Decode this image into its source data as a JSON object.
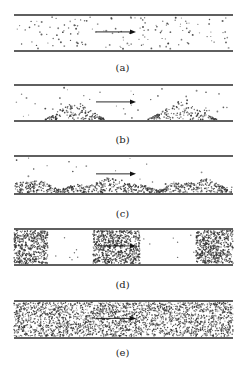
{
  "figure": {
    "panels": [
      {
        "id": "a",
        "label": "(a)",
        "regime": "dispersed",
        "top": 15,
        "bottom": 51,
        "label_y": 62
      },
      {
        "id": "b",
        "label": "(b)",
        "regime": "dunes",
        "top": 85,
        "bottom": 121,
        "label_y": 134
      },
      {
        "id": "c",
        "label": "(c)",
        "regime": "moving-bed",
        "top": 156,
        "bottom": 194,
        "label_y": 208
      },
      {
        "id": "d",
        "label": "(d)",
        "regime": "plugs",
        "top": 229,
        "bottom": 265,
        "label_y": 279
      },
      {
        "id": "e",
        "label": "(e)",
        "regime": "dense",
        "top": 301,
        "bottom": 338,
        "label_y": 347
      }
    ],
    "pipe": {
      "x_start": 14,
      "x_end": 233,
      "wall_color": "#2a2a2a"
    },
    "arrow": {
      "x_start": 96,
      "x_end": 136,
      "direction": "right",
      "icon": "flow-direction-arrow"
    },
    "particle_color": "#333333"
  }
}
